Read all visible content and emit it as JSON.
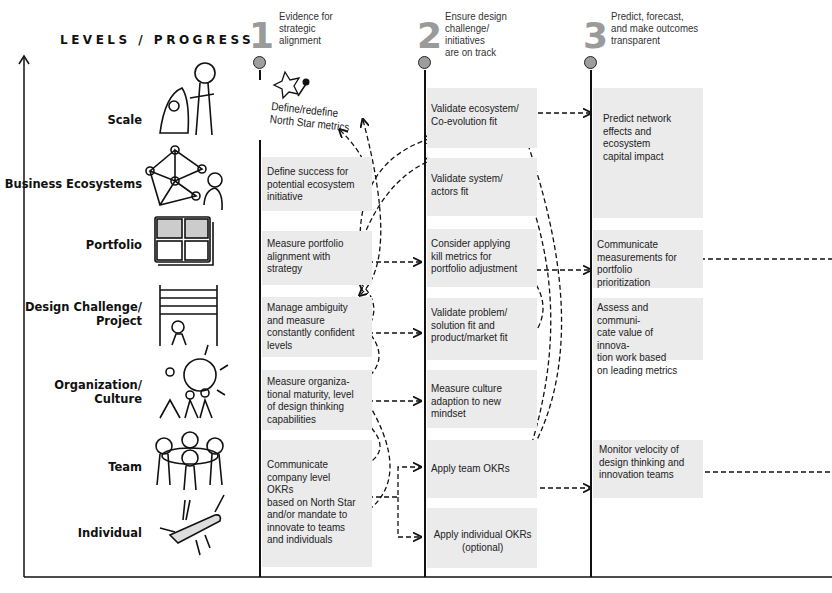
{
  "axis": {
    "title": "LEVELS / PROGRESS"
  },
  "levels": [
    {
      "label": "Scale",
      "icon": "rocket-person-icon"
    },
    {
      "label": "Business Ecosystems",
      "icon": "network-person-icon"
    },
    {
      "label": "Portfolio",
      "icon": "grid-portfolio-icon"
    },
    {
      "label": "Design Challenge/\nProject",
      "icon": "abacus-icon"
    },
    {
      "label": "Organization/\nCulture",
      "icon": "lightbulb-team-icon"
    },
    {
      "label": "Team",
      "icon": "team-circle-icon"
    },
    {
      "label": "Individual",
      "icon": "swiss-knife-icon"
    }
  ],
  "phases": [
    {
      "number": "1",
      "title": "Evidence for\nstrategic\nalignment"
    },
    {
      "number": "2",
      "title": "Ensure design\nchallenge/\ninitiatives\nare on track"
    },
    {
      "number": "3",
      "title": "Predict, forecast,\nand make outcomes\ntransparent"
    }
  ],
  "column1": {
    "north_star": "Define/redefine\nNorth Star metrics",
    "boxes": [
      "Define success for\npotential ecosystem\ninitiative",
      "Measure portfolio\nalignment with\nstrategy",
      "Manage ambiguity\nand measure\nconstantly confident\nlevels",
      "Measure organiza-\ntional maturity, level\nof design thinking\ncapabilities",
      "Communicate\ncompany level OKRs\nbased on North Star\nand/or mandate to\ninnovate to teams\nand individuals"
    ]
  },
  "column2": {
    "boxes": [
      "Validate ecosystem/\nCo-evolution fit",
      "Validate system/\nactors fit",
      "Consider applying\nkill metrics for\nportfolio adjustment",
      "Validate problem/\nsolution fit and\nproduct/market fit",
      "Measure culture\nadaption to new\nmindset",
      "Apply team OKRs",
      "Apply individual OKRs\n(optional)"
    ]
  },
  "column3": {
    "boxes": [
      "Predict network\neffects and\necosystem\ncapital impact",
      "Communicate\nmeasurements for\nportfolio prioritization",
      "Assess and communi-\ncate value of innova-\ntion work based\non leading metrics",
      "Monitor velocity of\ndesign thinking and\ninnovation teams"
    ]
  },
  "colors": {
    "box_fill": "#ebebeb",
    "pin_fill": "#9e9e9e",
    "phase_number": "#9a9a9a",
    "line": "#111111"
  }
}
